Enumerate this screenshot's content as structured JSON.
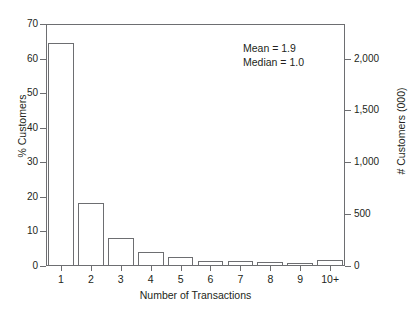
{
  "chart_data": {
    "type": "bar",
    "title": "Customers in 2011",
    "categories": [
      "1",
      "2",
      "3",
      "4",
      "5",
      "6",
      "7",
      "8",
      "9",
      "10+"
    ],
    "values": [
      64.4,
      18.2,
      8.1,
      4.1,
      2.5,
      1.5,
      1.5,
      1.1,
      0.9,
      1.6
    ],
    "series": [
      {
        "name": "% Customers",
        "values": [
          64.4,
          18.2,
          8.1,
          4.1,
          2.5,
          1.5,
          1.5,
          1.1,
          0.9,
          1.6
        ]
      }
    ],
    "xlabel": "Number of Transactions",
    "ylabel": "% Customers",
    "ylabel_right": "# Customers (000)",
    "ylim": [
      0,
      70
    ],
    "ylim_right": [
      0,
      2333
    ],
    "yticks": [
      70,
      60,
      50,
      40,
      30,
      20,
      10,
      0
    ],
    "yticks_right": [
      "2,000",
      "1,500",
      "1,000",
      "500",
      "0"
    ],
    "yticks_right_values": [
      2000,
      1500,
      1000,
      500,
      0
    ],
    "grid": false,
    "legend": "none",
    "annotations": [
      "Mean = 1.9",
      "Median = 1.0"
    ],
    "colors": {
      "bar_fill": "#ffffff",
      "bar_stroke": "#6d6e71",
      "axis": "#6d6e71",
      "text": "#231f20",
      "background": "#ffffff"
    }
  },
  "stats": {
    "mean_label": "Mean = 1.9",
    "median_label": "Median = 1.0"
  }
}
